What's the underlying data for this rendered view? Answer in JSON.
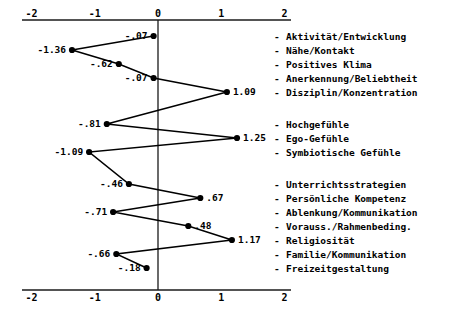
{
  "chart_data": {
    "type": "line",
    "orientation": "horizontal",
    "title": "",
    "xlabel": "",
    "ylabel": "",
    "xlim": [
      -2,
      2
    ],
    "xticks": [
      -2,
      -1,
      0,
      1,
      2
    ],
    "xtick_labels": [
      "-2",
      "-1",
      "0",
      "1",
      "2"
    ],
    "grid": false,
    "legend": null,
    "zero_reference_line": 0,
    "axis_top": true,
    "axis_bottom": true,
    "categories": [
      "Aktivität/Entwicklung",
      "Nähe/Kontakt",
      "Positives Klima",
      "Anerkennung/Beliebtheit",
      "Disziplin/Konzentration",
      "Hochgefühle",
      "Ego-Gefühle",
      "Symbiotische Gefühle",
      "Unterrichtsstrategien",
      "Persönliche Kompetenz",
      "Ablenkung/Kommunikation",
      "Vorauss./Rahmenbeding.",
      "Religiosität",
      "Familie/Kommunikation",
      "Freizeitgestaltung"
    ],
    "values": [
      -0.07,
      -1.36,
      -0.62,
      -0.07,
      1.09,
      -0.81,
      1.25,
      -1.09,
      -0.46,
      0.67,
      -0.71,
      0.48,
      1.17,
      -0.66,
      -0.18
    ],
    "value_labels": [
      "-.07",
      "-1.36",
      "-.62",
      "-.07",
      "1.09",
      "-.81",
      "1.25",
      "-1.09",
      "-.46",
      ".67",
      "-.71",
      ".48",
      "1.17",
      "-.66",
      "-.18"
    ],
    "label_sides": [
      "left",
      "left",
      "left",
      "left",
      "right",
      "left",
      "right",
      "left",
      "left",
      "right",
      "left",
      "right",
      "right",
      "left",
      "left"
    ],
    "group_breaks": [
      5,
      8
    ],
    "dash_prefix": "-",
    "line_color": "#000000",
    "marker_color": "#000000",
    "axis_color": "#1a1a1a",
    "background_color": "#ffffff"
  }
}
